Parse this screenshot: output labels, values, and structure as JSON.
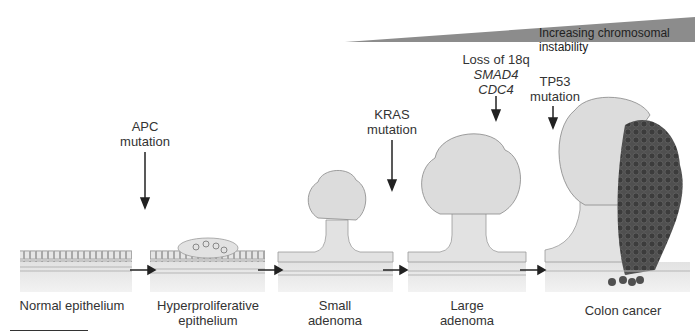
{
  "instability_bar": {
    "label": "Increasing chromosomal instability",
    "color": "#8c8c8c"
  },
  "stages": [
    {
      "name": "Normal epithelium"
    },
    {
      "name": "Hyperproliferative",
      "name2": "epithelium"
    },
    {
      "name": "Small",
      "name2": "adenoma"
    },
    {
      "name": "Large",
      "name2": "adenoma"
    },
    {
      "name": "Colon cancer"
    }
  ],
  "mutations": [
    {
      "line1": "APC",
      "line2": "mutation"
    },
    {
      "line1": "KRAS",
      "line2": "mutation"
    },
    {
      "line1": "Loss of 18q",
      "gene1": "SMAD4",
      "gene2": "CDC4"
    },
    {
      "line1": "TP53",
      "line2": "mutation"
    }
  ],
  "colors": {
    "tissue": "#d9d9d9",
    "tissue_dark": "#bdbdbd",
    "cancer": "#4a4a4a",
    "arrow": "#222222"
  }
}
